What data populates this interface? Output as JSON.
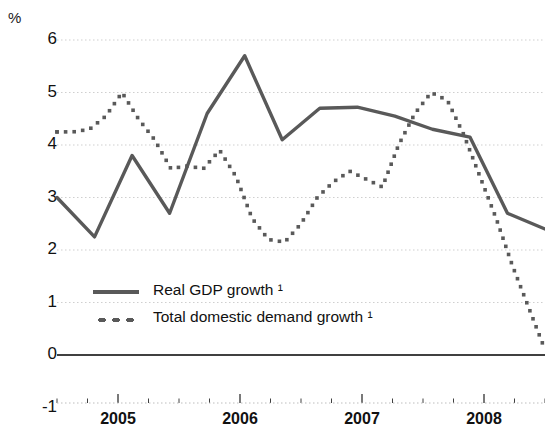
{
  "chart_data": {
    "type": "line",
    "title": "",
    "subtitle": "",
    "unit_label": "%",
    "xlabel": "",
    "ylabel": "%",
    "ylim": [
      -1,
      6
    ],
    "xlim": [
      2004.5,
      2008.5
    ],
    "y_ticks": [
      6,
      5,
      4,
      3,
      2,
      1,
      0,
      -1
    ],
    "y_tick_labels": [
      "6",
      "5",
      "4",
      "3",
      "2",
      "1",
      "0",
      "-1"
    ],
    "x_ticks": [
      2005,
      2006,
      2007,
      2008
    ],
    "x_tick_labels": [
      "2005",
      "2006",
      "2007",
      "2008"
    ],
    "x_minor_interval": 0.25,
    "grid": true,
    "grid_style": "dotted-horizontal",
    "zero_line": true,
    "legend_position": "inside-lower-left",
    "x": [
      2004.5,
      2004.75,
      2005.0,
      2005.25,
      2005.5,
      2005.75,
      2006.0,
      2006.25,
      2006.5,
      2006.75,
      2007.0,
      2007.25,
      2007.5,
      2007.75
    ],
    "series": [
      {
        "name": "Real GDP growth ¹",
        "style": "solid",
        "color": "#595959",
        "values": [
          3.0,
          2.25,
          3.8,
          2.7,
          4.6,
          5.7,
          4.1,
          4.7,
          4.72,
          4.55,
          4.3,
          4.15,
          2.7,
          2.4
        ]
      },
      {
        "name": "Total domestic demand growth ¹",
        "style": "dotted",
        "color": "#595959",
        "values": [
          4.25,
          4.25,
          4.55,
          5.0,
          4.1,
          3.55,
          3.7,
          2.35,
          2.15,
          3.3,
          3.5,
          3.2,
          4.6,
          5.0
        ],
        "values_extended": [
          4.25,
          4.25,
          4.3,
          4.55,
          5.0,
          4.5,
          4.1,
          3.55,
          3.6,
          3.55,
          3.9,
          3.4,
          2.6,
          2.2,
          2.15,
          2.5,
          3.0,
          3.3,
          3.5,
          3.35,
          3.2,
          4.0,
          4.6,
          5.0,
          4.85,
          4.2,
          3.4,
          2.6,
          1.7,
          0.9,
          0.1
        ]
      }
    ],
    "annotations": []
  },
  "legend": {
    "items": [
      {
        "label": "Real GDP growth ¹",
        "style": "solid"
      },
      {
        "label": "Total domestic demand growth ¹",
        "style": "dotted"
      }
    ]
  },
  "colors": {
    "line": "#595959",
    "grid": "#cfcfcf",
    "axis": "#404040",
    "text": "#111111"
  }
}
